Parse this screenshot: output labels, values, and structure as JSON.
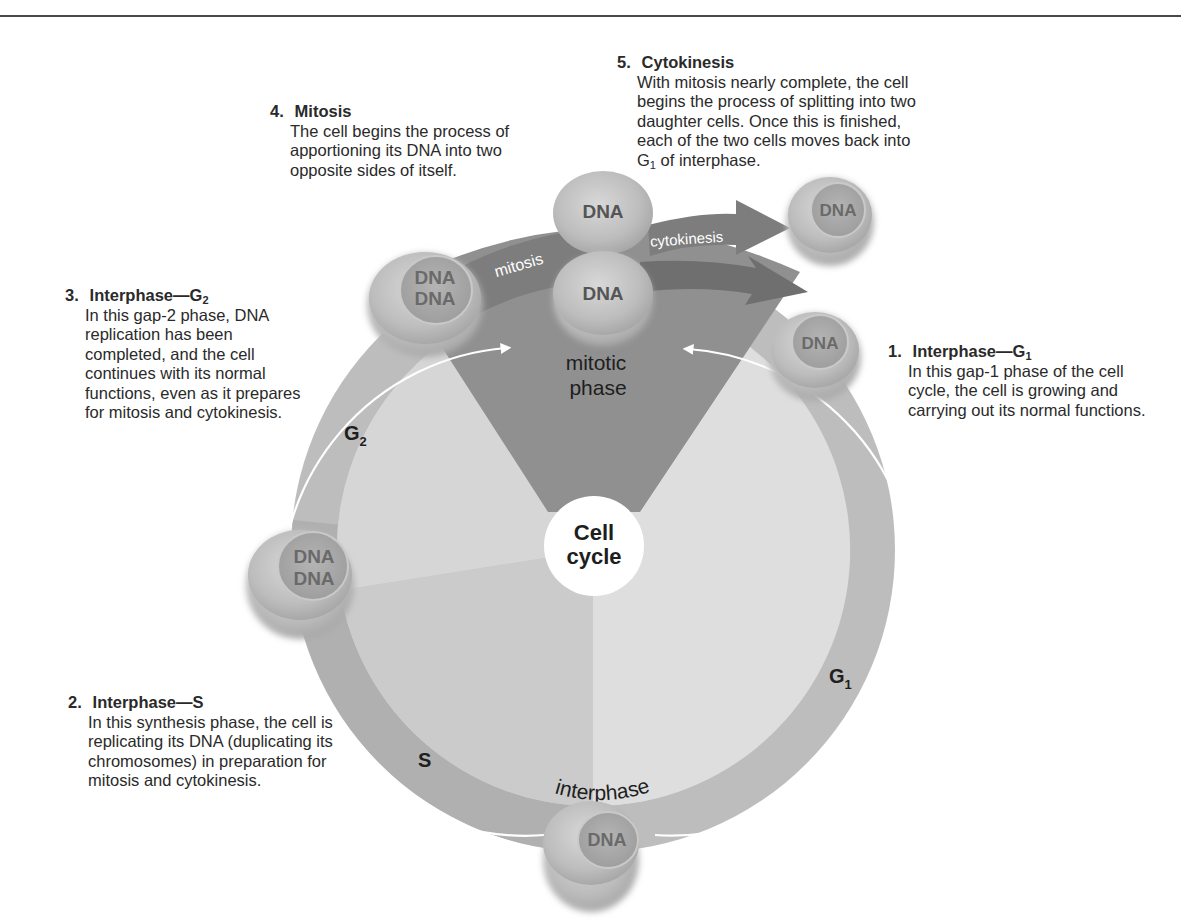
{
  "diagram": {
    "title": "Cell cycle",
    "center_label_line1": "Cell",
    "center_label_line2": "cycle",
    "mitotic_phase_line1": "mitotic",
    "mitotic_phase_line2": "phase",
    "interphase_label": "interphase",
    "ring_labels": {
      "g1": "G",
      "g1_sub": "1",
      "g2": "G",
      "g2_sub": "2",
      "s": "S"
    },
    "arrow_labels": {
      "mitosis": "mitosis",
      "cytokinesis": "cytokinesis"
    },
    "cells": [
      {
        "id": "g1-cell",
        "lines": [
          "DNA"
        ]
      },
      {
        "id": "s-cell",
        "lines": [
          "DNA"
        ]
      },
      {
        "id": "g2-early-cell",
        "lines": [
          "DNA",
          "DNA"
        ]
      },
      {
        "id": "g2-late-cell",
        "lines": [
          "DNA",
          "DNA"
        ]
      },
      {
        "id": "dividing-cell-top",
        "lines": [
          "DNA"
        ]
      },
      {
        "id": "dividing-cell-bottom",
        "lines": [
          "DNA"
        ]
      },
      {
        "id": "daughter-cell",
        "lines": [
          "DNA"
        ]
      }
    ],
    "colors": {
      "outer_ring": "#b9b9b9",
      "inner_disk_light": "#dcdcdc",
      "inner_disk_mid": "#cfcfcf",
      "s_sector": "#c6c6c6",
      "mitotic_wedge": "#8f8f8f",
      "arrow": "#7a7a7a",
      "cell_outer": "#c8c8c8",
      "cell_nucleus": "#a9a9a9",
      "center_circle": "#ffffff",
      "rule": "#4a4a4a"
    }
  },
  "callouts": [
    {
      "number": "1.",
      "heading": "Interphase—G",
      "heading_sub": "1",
      "body": "In this gap-1 phase of the cell cycle, the cell is growing and carrying out its normal functions."
    },
    {
      "number": "2.",
      "heading": "Interphase—S",
      "heading_sub": "",
      "body": "In this synthesis phase, the cell is replicating its DNA (duplicating its chromosomes) in preparation for mitosis and cytokinesis."
    },
    {
      "number": "3.",
      "heading": "Interphase—G",
      "heading_sub": "2",
      "body": "In this gap-2 phase, DNA replication has been completed, and the cell continues with its normal functions, even as it prepares for mitosis and cytokinesis."
    },
    {
      "number": "4.",
      "heading": "Mitosis",
      "heading_sub": "",
      "body": "The cell begins the process of apportioning its DNA into two opposite sides of itself."
    },
    {
      "number": "5.",
      "heading": "Cytokinesis",
      "heading_sub": "",
      "body_pre": "With mitosis nearly complete, the cell begins the process of splitting into two daughter cells. Once this is finished, each of the two cells moves back into G",
      "body_sub": "1",
      "body_post": " of interphase."
    }
  ]
}
